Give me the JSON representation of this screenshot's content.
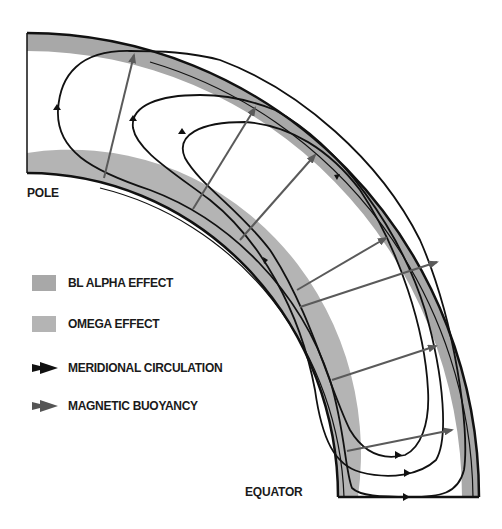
{
  "labels": {
    "pole": "POLE",
    "equator": "EQUATOR"
  },
  "legend": [
    {
      "label": "BL  ALPHA  EFFECT",
      "kind": "swatch",
      "color": "#a8a8a8"
    },
    {
      "label": "OMEGA EFFECT",
      "kind": "swatch",
      "color": "#b4b4b4"
    },
    {
      "label": "MERIDIONAL CIRCULATION",
      "kind": "arrow",
      "color": "#111111"
    },
    {
      "label": "MAGNETIC BUOYANCY",
      "kind": "arrow",
      "color": "#555555"
    }
  ],
  "colors": {
    "outline": "#111111",
    "alpha_band": "#a8a8a8",
    "omega_band": "#b4b4b4",
    "circulation": "#111111",
    "buoyancy": "#5a5a5a"
  }
}
